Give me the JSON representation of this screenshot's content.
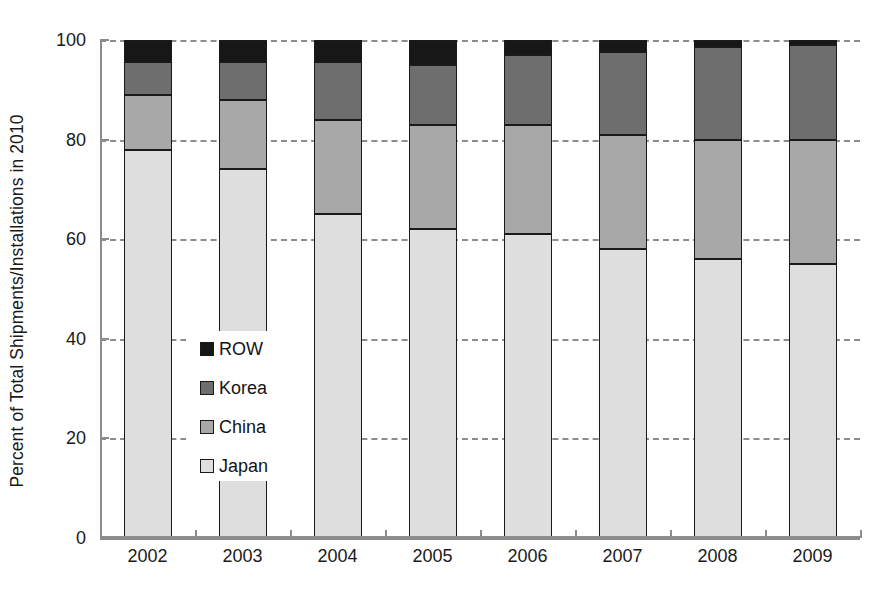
{
  "chart_data": {
    "type": "bar",
    "subtype": "stacked-bar-100",
    "title": "",
    "xlabel": "",
    "ylabel": "Percent of Total Shipments/Installations in 2010",
    "categories": [
      "2002",
      "2003",
      "2004",
      "2005",
      "2006",
      "2007",
      "2008",
      "2009"
    ],
    "ylim": [
      0,
      100
    ],
    "yticks": [
      0,
      20,
      40,
      60,
      80,
      100
    ],
    "ytick_labels": [
      "0",
      "20",
      "40",
      "60",
      "80",
      "100"
    ],
    "grid": "horizontal-dashed",
    "legend_position": "inside-left-middle",
    "stack_order_bottom_to_top": [
      "Japan",
      "China",
      "Korea",
      "ROW"
    ],
    "series": [
      {
        "name": "Japan",
        "color": "#dedede",
        "values": [
          78,
          74,
          65,
          62,
          61,
          58,
          56,
          55
        ]
      },
      {
        "name": "China",
        "color": "#a8a8a8",
        "values": [
          11,
          14,
          19,
          21,
          22,
          23,
          24,
          25
        ]
      },
      {
        "name": "Korea",
        "color": "#6e6e6e",
        "values": [
          6.5,
          7.5,
          11.5,
          12,
          14,
          16.5,
          18.5,
          19
        ]
      },
      {
        "name": "ROW",
        "color": "#171717",
        "values": [
          4.5,
          4.5,
          4.5,
          5,
          3,
          2.5,
          1.5,
          1
        ]
      }
    ]
  },
  "legend": {
    "entries": [
      {
        "label": "ROW",
        "swatch_color": "#171717"
      },
      {
        "label": "Korea",
        "swatch_color": "#6e6e6e"
      },
      {
        "label": "China",
        "swatch_color": "#a8a8a8"
      },
      {
        "label": "Japan",
        "swatch_color": "#dedede"
      }
    ]
  },
  "axes": {
    "y_title": "Percent of Total Shipments/Installations in 2010",
    "gridline_color": "#8c8c8c",
    "axis_color": "#8c8c8c",
    "bar_outline_color": "#1a1a1a"
  }
}
